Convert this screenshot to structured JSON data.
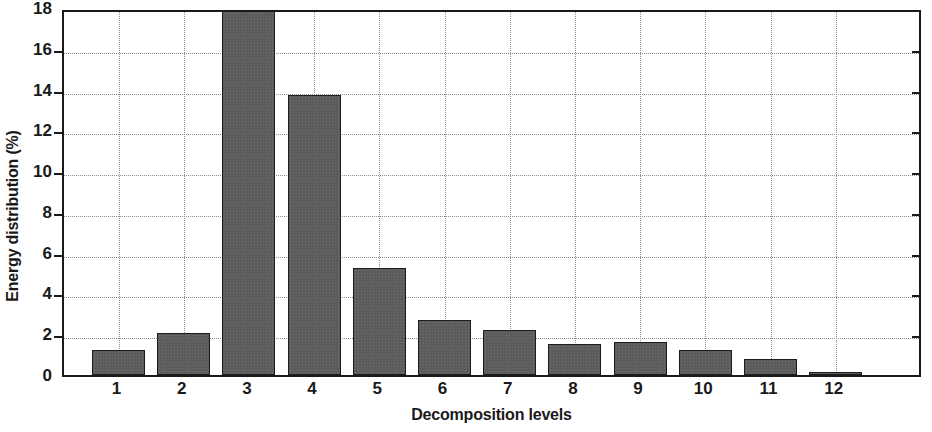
{
  "chart_data": {
    "type": "bar",
    "title": "",
    "xlabel": "Decomposition levels",
    "ylabel": "Energy distribution (%)",
    "categories": [
      "1",
      "2",
      "3",
      "4",
      "5",
      "6",
      "7",
      "8",
      "9",
      "10",
      "11",
      "12"
    ],
    "values": [
      1.25,
      2.05,
      18.0,
      13.75,
      5.25,
      2.7,
      2.2,
      1.5,
      1.6,
      1.25,
      0.8,
      0.15
    ],
    "ylim": [
      0,
      18
    ],
    "ytick_labels": [
      "0",
      "2",
      "4",
      "6",
      "8",
      "10",
      "12",
      "14",
      "16",
      "18"
    ],
    "ytick_values": [
      0,
      2,
      4,
      6,
      8,
      10,
      12,
      14,
      16,
      18
    ],
    "grid": "dotted-both-axes",
    "legend": "none",
    "bar_color": "#5c5c5c",
    "bar_edge_color": "#1c1c1c",
    "axis_color": "#1a1a1a",
    "grid_color": "#8c8c8c",
    "background_color": "#ffffff"
  }
}
